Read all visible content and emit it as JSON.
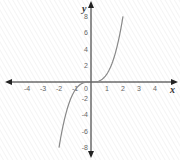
{
  "chart_data": {
    "type": "line",
    "title": "",
    "function": "y = x^3",
    "xlabel": "x",
    "ylabel": "y",
    "xlim": [
      -5,
      5
    ],
    "ylim": [
      -9,
      9
    ],
    "grid": false,
    "x_ticks": [
      -4,
      -3,
      -2,
      -1,
      0,
      1,
      2,
      3,
      4
    ],
    "y_ticks": [
      8,
      6,
      4,
      2,
      -2,
      -4,
      -6,
      -8
    ],
    "series": [
      {
        "name": "y = x^3",
        "x": [
          -2,
          -1.5,
          -1,
          -0.5,
          0,
          0.5,
          1,
          1.5,
          2
        ],
        "y": [
          -8,
          -3.375,
          -1,
          -0.125,
          0,
          0.125,
          1,
          3.375,
          8
        ],
        "color": "#888888"
      }
    ]
  },
  "labels": {
    "x_axis": "x",
    "y_axis": "y",
    "origin": "0"
  },
  "colors": {
    "axis": "#222222",
    "curve": "#888888",
    "tick_text": "#666666"
  }
}
